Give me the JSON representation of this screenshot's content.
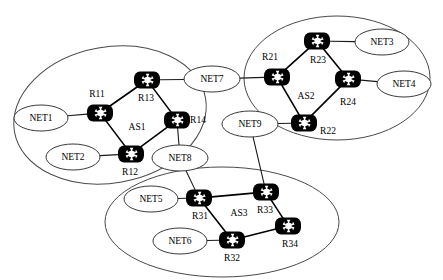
{
  "diagram": {
    "type": "network-topology",
    "title": "",
    "width": 443,
    "height": 280,
    "background_color": "#ffffff",
    "router_color": "#000000",
    "router_glyph_color": "#ffffff",
    "ellipse_stroke_color": "#4a4a4a",
    "link_color": "#000000"
  },
  "autonomous_systems": [
    {
      "id": "as1",
      "label": "AS1",
      "label_pos": {
        "x": 137,
        "y": 128
      },
      "ellipse": {
        "cx": 110,
        "cy": 115,
        "rx": 97,
        "ry": 68,
        "rotate": -10
      },
      "routers": [
        "r11",
        "r12",
        "r13",
        "r14"
      ],
      "networks": [
        "net1",
        "net2"
      ]
    },
    {
      "id": "as2",
      "label": "AS2",
      "label_pos": {
        "x": 306,
        "y": 97
      },
      "ellipse": {
        "cx": 337,
        "cy": 78,
        "rx": 93,
        "ry": 62,
        "rotate": 0
      },
      "routers": [
        "r21",
        "r22",
        "r23",
        "r24"
      ],
      "networks": [
        "net3",
        "net4"
      ]
    },
    {
      "id": "as3",
      "label": "AS3",
      "label_pos": {
        "x": 239,
        "y": 214
      },
      "ellipse": {
        "cx": 222,
        "cy": 222,
        "rx": 117,
        "ry": 55,
        "rotate": 0
      },
      "routers": [
        "r31",
        "r32",
        "r33",
        "r34"
      ],
      "networks": [
        "net5",
        "net6"
      ]
    }
  ],
  "routers": [
    {
      "id": "r11",
      "label": "R11",
      "x": 100,
      "y": 113,
      "label_pos": {
        "x": 97,
        "y": 95
      }
    },
    {
      "id": "r12",
      "label": "R12",
      "x": 131,
      "y": 154,
      "label_pos": {
        "x": 130,
        "y": 173
      }
    },
    {
      "id": "r13",
      "label": "R13",
      "x": 147,
      "y": 80,
      "label_pos": {
        "x": 146,
        "y": 99
      }
    },
    {
      "id": "r14",
      "label": "R14",
      "x": 177,
      "y": 120,
      "label_pos": {
        "x": 198,
        "y": 121
      }
    },
    {
      "id": "r21",
      "label": "R21",
      "x": 277,
      "y": 77,
      "label_pos": {
        "x": 270,
        "y": 58
      }
    },
    {
      "id": "r22",
      "label": "R22",
      "x": 304,
      "y": 123,
      "label_pos": {
        "x": 328,
        "y": 132
      }
    },
    {
      "id": "r23",
      "label": "R23",
      "x": 317,
      "y": 41,
      "label_pos": {
        "x": 318,
        "y": 61
      }
    },
    {
      "id": "r24",
      "label": "R24",
      "x": 348,
      "y": 79,
      "label_pos": {
        "x": 348,
        "y": 103
      }
    },
    {
      "id": "r31",
      "label": "R31",
      "x": 199,
      "y": 198,
      "label_pos": {
        "x": 200,
        "y": 217
      }
    },
    {
      "id": "r32",
      "label": "R32",
      "x": 232,
      "y": 240,
      "label_pos": {
        "x": 232,
        "y": 259
      }
    },
    {
      "id": "r33",
      "label": "R33",
      "x": 266,
      "y": 192,
      "label_pos": {
        "x": 265,
        "y": 211
      }
    },
    {
      "id": "r34",
      "label": "R34",
      "x": 288,
      "y": 226,
      "label_pos": {
        "x": 290,
        "y": 245
      }
    }
  ],
  "networks": [
    {
      "id": "net1",
      "label": "NET1",
      "cx": 41,
      "cy": 118,
      "rx": 27,
      "ry": 13
    },
    {
      "id": "net2",
      "label": "NET2",
      "cx": 73,
      "cy": 157,
      "rx": 27,
      "ry": 13
    },
    {
      "id": "net3",
      "label": "NET3",
      "cx": 382,
      "cy": 42,
      "rx": 27,
      "ry": 13
    },
    {
      "id": "net4",
      "label": "NET4",
      "cx": 404,
      "cy": 84,
      "rx": 27,
      "ry": 13
    },
    {
      "id": "net5",
      "label": "NET5",
      "cx": 151,
      "cy": 199,
      "rx": 27,
      "ry": 13
    },
    {
      "id": "net6",
      "label": "NET6",
      "cx": 180,
      "cy": 241,
      "rx": 27,
      "ry": 13
    },
    {
      "id": "net7",
      "label": "NET7",
      "cx": 212,
      "cy": 79,
      "rx": 28,
      "ry": 13
    },
    {
      "id": "net8",
      "label": "NET8",
      "cx": 180,
      "cy": 158,
      "rx": 28,
      "ry": 13
    },
    {
      "id": "net9",
      "label": "NET9",
      "cx": 250,
      "cy": 124,
      "rx": 28,
      "ry": 13
    }
  ],
  "links": [
    {
      "from": "r11",
      "to": "r13",
      "kind": "intra-as"
    },
    {
      "from": "r13",
      "to": "r14",
      "kind": "intra-as"
    },
    {
      "from": "r11",
      "to": "r12",
      "kind": "intra-as"
    },
    {
      "from": "r12",
      "to": "r14",
      "kind": "intra-as"
    },
    {
      "from": "r21",
      "to": "r23",
      "kind": "intra-as"
    },
    {
      "from": "r23",
      "to": "r24",
      "kind": "intra-as"
    },
    {
      "from": "r21",
      "to": "r22",
      "kind": "intra-as"
    },
    {
      "from": "r22",
      "to": "r24",
      "kind": "intra-as"
    },
    {
      "from": "r31",
      "to": "r33",
      "kind": "intra-as"
    },
    {
      "from": "r31",
      "to": "r32",
      "kind": "intra-as"
    },
    {
      "from": "r33",
      "to": "r34",
      "kind": "intra-as"
    },
    {
      "from": "r32",
      "to": "r34",
      "kind": "intra-as"
    },
    {
      "from": "net1",
      "to": "r11",
      "kind": "lan"
    },
    {
      "from": "net2",
      "to": "r12",
      "kind": "lan"
    },
    {
      "from": "net3",
      "to": "r23",
      "kind": "lan"
    },
    {
      "from": "net4",
      "to": "r24",
      "kind": "lan"
    },
    {
      "from": "net5",
      "to": "r31",
      "kind": "lan"
    },
    {
      "from": "net6",
      "to": "r32",
      "kind": "lan"
    },
    {
      "from": "net7",
      "to": "r13",
      "kind": "transit"
    },
    {
      "from": "net7",
      "to": "r21",
      "kind": "transit"
    },
    {
      "from": "net8",
      "to": "r14",
      "kind": "transit"
    },
    {
      "from": "net8",
      "to": "r31",
      "kind": "transit"
    },
    {
      "from": "net9",
      "to": "r22",
      "kind": "transit"
    },
    {
      "from": "net9",
      "to": "r33",
      "kind": "transit"
    }
  ]
}
